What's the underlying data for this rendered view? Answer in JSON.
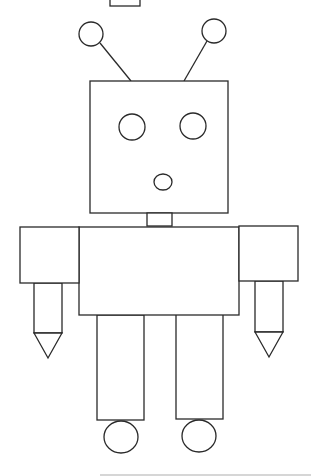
{
  "figure": {
    "label": "robot-drawing",
    "stroke_color": "#2a2a2a",
    "fill_color": "#ffffff",
    "background": "#ffffff"
  },
  "shapes": {
    "top_rect": {
      "x": 110,
      "y": -1,
      "w": 30,
      "h": 7
    },
    "antenna_left_ball": {
      "cx": 91,
      "cy": 34,
      "r": 12
    },
    "antenna_right_ball": {
      "cx": 214,
      "cy": 31,
      "r": 12
    },
    "antenna_left_stick": {
      "x1": 100,
      "y1": 43,
      "x2": 131,
      "y2": 81
    },
    "antenna_right_stick": {
      "x1": 207,
      "y1": 41,
      "x2": 184,
      "y2": 81
    },
    "head": {
      "x": 90,
      "y": 81,
      "w": 138,
      "h": 132
    },
    "eye_left": {
      "cx": 132,
      "cy": 127,
      "r": 13
    },
    "eye_right": {
      "cx": 193,
      "cy": 126,
      "r": 13
    },
    "mouth": {
      "cx": 163,
      "cy": 182,
      "rx": 9,
      "ry": 8
    },
    "neck": {
      "x": 147,
      "y": 213,
      "w": 25,
      "h": 13
    },
    "body": {
      "x": 79,
      "y": 227,
      "w": 160,
      "h": 88
    },
    "arm_left": {
      "x": 20,
      "y": 227,
      "w": 59,
      "h": 56
    },
    "arm_right": {
      "x": 239,
      "y": 226,
      "w": 59,
      "h": 55
    },
    "forearm_left": {
      "x": 34,
      "y": 283,
      "w": 28,
      "h": 50
    },
    "forearm_right": {
      "x": 255,
      "y": 281,
      "w": 28,
      "h": 51
    },
    "hand_left": {
      "points": "34,333 62,333 48,358"
    },
    "hand_right": {
      "points": "255,332 283,332 269,357"
    },
    "leg_left": {
      "x": 97,
      "y": 315,
      "w": 47,
      "h": 105
    },
    "leg_right": {
      "x": 176,
      "y": 314,
      "w": 47,
      "h": 105
    },
    "foot_left": {
      "cx": 121,
      "cy": 437,
      "rx": 17,
      "ry": 16
    },
    "foot_right": {
      "cx": 199,
      "cy": 436,
      "rx": 17,
      "ry": 16
    },
    "bottom_line": {
      "x1": 100,
      "y1": 475,
      "x2": 311,
      "y2": 475
    }
  }
}
